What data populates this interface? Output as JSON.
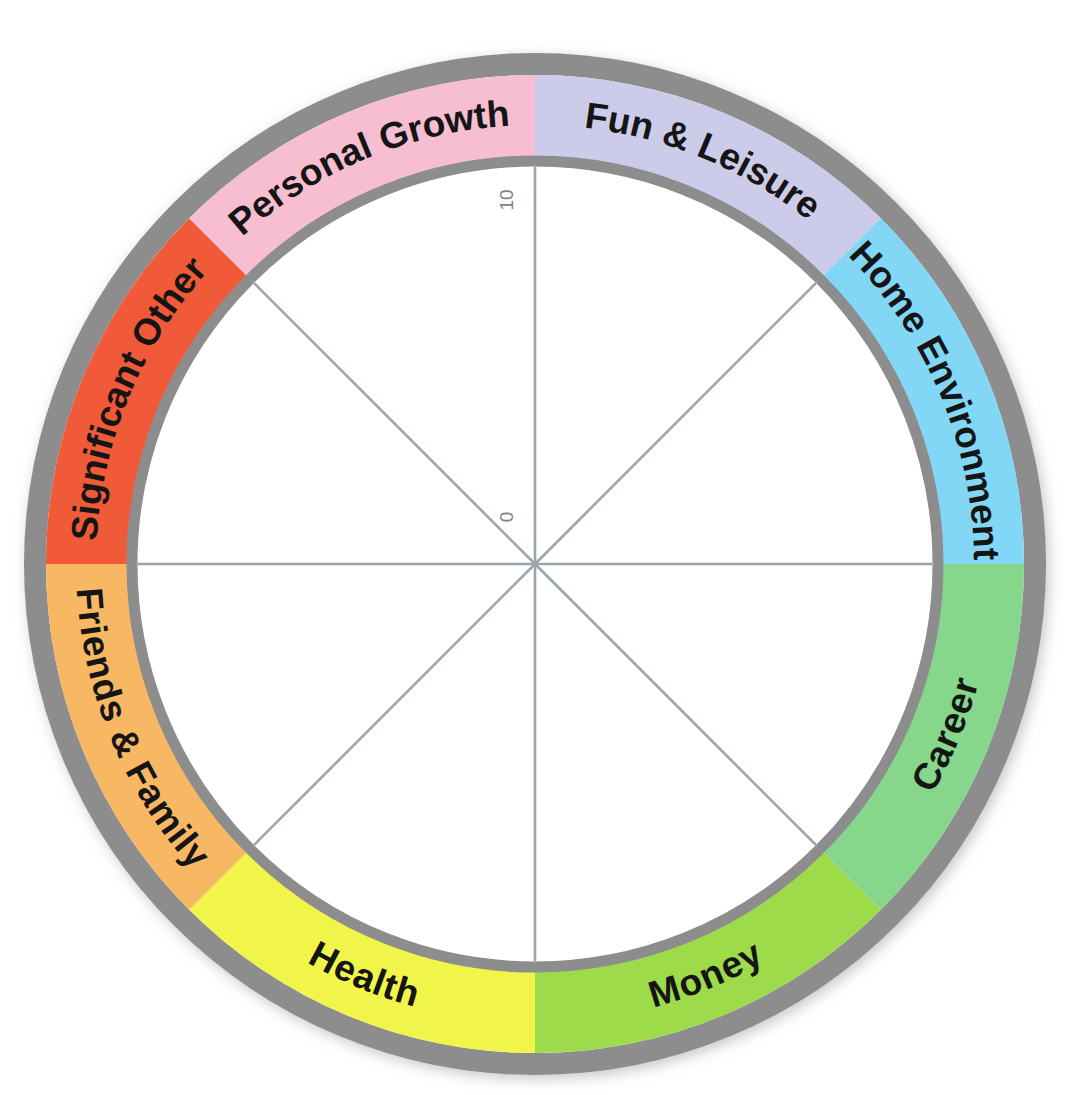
{
  "chart_data": {
    "type": "pie",
    "subtitle": "",
    "xlabel": "",
    "ylabel": "",
    "grid": false,
    "legend_position": "none",
    "axis": {
      "min_tick_label": "0",
      "max_tick_label": "10",
      "range": [
        0,
        10
      ],
      "orientation": "radial-vertical",
      "tick_labels": [
        "0",
        "10"
      ],
      "tick_rotation_degrees": -90
    },
    "spokes": 8,
    "spoke_color": "#9aa5ad",
    "categories": [
      "Fun & Leisure",
      "Home Environment",
      "Career",
      "Money",
      "Health",
      "Friends & Family",
      "Significant Other",
      "Personal Growth"
    ],
    "values": [
      0,
      0,
      0,
      0,
      0,
      0,
      0,
      0
    ],
    "segment_span_degrees": 45,
    "start_angle_degrees": 0,
    "colors": [
      "#ccccea",
      "#82d7f7",
      "#86d68c",
      "#9edb4c",
      "#f2f549",
      "#f8b863",
      "#f05a37",
      "#f7bdd0"
    ],
    "ring": {
      "outer_radius": 511,
      "band_outer_radius": 489,
      "band_inner_radius": 403,
      "border_color": "#8d8d8d",
      "inner_fill": "#ffffff"
    },
    "center": {
      "x": 535,
      "y": 564
    }
  },
  "wheel": {
    "title": "Wheel of Life",
    "segments": [
      {
        "label": "Fun & Leisure",
        "color": "#ccccea",
        "start": 0,
        "end": 45,
        "flip": false,
        "name": "fun-and-leisure"
      },
      {
        "label": "Home Environment",
        "color": "#82d7f7",
        "start": 45,
        "end": 90,
        "flip": false,
        "name": "home-environment"
      },
      {
        "label": "Career",
        "color": "#86d68c",
        "start": 90,
        "end": 135,
        "flip": false,
        "name": "career"
      },
      {
        "label": "Money",
        "color": "#9edb4c",
        "start": 135,
        "end": 180,
        "flip": false,
        "name": "money"
      },
      {
        "label": "Health",
        "color": "#f2f549",
        "start": 180,
        "end": 225,
        "flip": false,
        "name": "health"
      },
      {
        "label": "Friends & Family",
        "color": "#f8b863",
        "start": 225,
        "end": 270,
        "flip": false,
        "name": "friends-and-family"
      },
      {
        "label": "Significant Other",
        "color": "#f05a37",
        "start": 270,
        "end": 315,
        "flip": false,
        "name": "significant-other"
      },
      {
        "label": "Personal Growth",
        "color": "#f7bdd0",
        "start": 315,
        "end": 360,
        "flip": false,
        "name": "personal-growth"
      }
    ],
    "axis_labels": {
      "outer": "10",
      "inner": "0"
    },
    "colors": {
      "ring_border": "#8d8d8d",
      "ring_border_light": "#c9c9c9",
      "spoke": "#9aa5ad",
      "label_text": "#151515",
      "tick_text": "#808080",
      "background": "#ffffff"
    }
  }
}
